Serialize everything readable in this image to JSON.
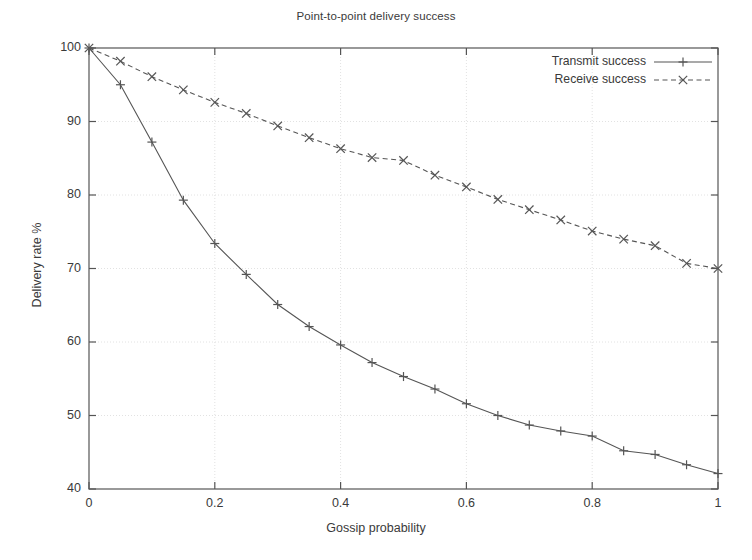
{
  "chart_data": {
    "type": "line",
    "title": "Point-to-point delivery success",
    "xlabel": "Gossip probability",
    "ylabel": "Delivery rate %",
    "xlim": [
      0,
      1
    ],
    "ylim": [
      40,
      100
    ],
    "xticks": [
      0,
      0.2,
      0.4,
      0.6,
      0.8,
      1
    ],
    "xticklabels": [
      "0",
      "0.2",
      "0.4",
      "0.6",
      "0.8",
      "1"
    ],
    "yticks": [
      40,
      50,
      60,
      70,
      80,
      90,
      100
    ],
    "yticklabels": [
      "40",
      "50",
      "60",
      "70",
      "80",
      "90",
      "100"
    ],
    "grid": true,
    "legend_position": "top-right",
    "x": [
      0,
      0.05,
      0.1,
      0.15,
      0.2,
      0.25,
      0.3,
      0.35,
      0.4,
      0.45,
      0.5,
      0.55,
      0.6,
      0.65,
      0.7,
      0.75,
      0.8,
      0.85,
      0.9,
      0.95,
      1
    ],
    "series": [
      {
        "name": "Transmit success",
        "marker": "plus",
        "dash": "solid",
        "color": "#555555",
        "values": [
          100,
          95,
          87.2,
          79.3,
          73.4,
          69.2,
          65.1,
          62.1,
          59.6,
          57.2,
          55.3,
          53.6,
          51.6,
          50,
          48.7,
          47.9,
          47.2,
          45.2,
          44.7,
          43.3,
          42.1
        ]
      },
      {
        "name": "Receive success",
        "marker": "cross",
        "dash": "dashed",
        "color": "#555555",
        "values": [
          100,
          98.2,
          96.1,
          94.3,
          92.6,
          91.1,
          89.4,
          87.8,
          86.3,
          85.1,
          84.7,
          82.7,
          81.1,
          79.4,
          78,
          76.6,
          75.1,
          74,
          73.1,
          70.7,
          70
        ]
      }
    ]
  },
  "legend": {
    "items": [
      {
        "label": "Transmit success"
      },
      {
        "label": "Receive success"
      }
    ]
  },
  "colors": {
    "axis": "#555555",
    "grid": "#e2e2e2",
    "text": "#3a3a3a",
    "background": "#ffffff"
  }
}
